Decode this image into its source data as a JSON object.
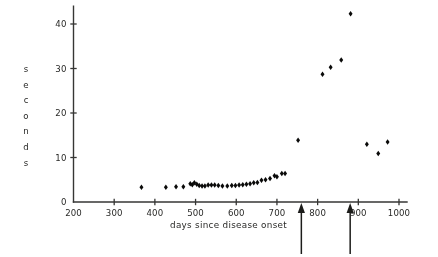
{
  "figure": {
    "background_color": "#ffffff",
    "ink_color": "#111110"
  },
  "chart_data": {
    "type": "scatter",
    "title": "",
    "xlabel": "days since disease onset",
    "ylabel": "seconds",
    "ylabel_chars": [
      "s",
      "e",
      "c",
      "o",
      "n",
      "d",
      "s"
    ],
    "xlim": [
      200,
      1000
    ],
    "ylim": [
      0,
      44
    ],
    "xticks": [
      200,
      300,
      400,
      500,
      600,
      700,
      800,
      900,
      1000
    ],
    "xtick_labels": [
      "200",
      "300",
      "400",
      "500",
      "600",
      "700",
      "800",
      "900",
      "1000"
    ],
    "yticks": [
      0,
      10,
      20,
      30,
      40
    ],
    "ytick_labels": [
      "0",
      "10",
      "20",
      "30",
      "40"
    ],
    "grid": false,
    "legend": null,
    "marker": "diamond",
    "marker_color": "#111110",
    "points": [
      {
        "x": 367,
        "y": 3.3
      },
      {
        "x": 427,
        "y": 3.3
      },
      {
        "x": 452,
        "y": 3.4
      },
      {
        "x": 470,
        "y": 3.4
      },
      {
        "x": 487,
        "y": 4.1
      },
      {
        "x": 492,
        "y": 3.9
      },
      {
        "x": 497,
        "y": 4.3
      },
      {
        "x": 503,
        "y": 4.0
      },
      {
        "x": 509,
        "y": 3.7
      },
      {
        "x": 516,
        "y": 3.6
      },
      {
        "x": 523,
        "y": 3.6
      },
      {
        "x": 531,
        "y": 3.8
      },
      {
        "x": 539,
        "y": 3.8
      },
      {
        "x": 547,
        "y": 3.8
      },
      {
        "x": 556,
        "y": 3.7
      },
      {
        "x": 566,
        "y": 3.6
      },
      {
        "x": 578,
        "y": 3.6
      },
      {
        "x": 589,
        "y": 3.7
      },
      {
        "x": 598,
        "y": 3.7
      },
      {
        "x": 607,
        "y": 3.8
      },
      {
        "x": 616,
        "y": 3.9
      },
      {
        "x": 625,
        "y": 4.0
      },
      {
        "x": 634,
        "y": 4.1
      },
      {
        "x": 643,
        "y": 4.3
      },
      {
        "x": 652,
        "y": 4.4
      },
      {
        "x": 662,
        "y": 4.9
      },
      {
        "x": 672,
        "y": 5.0
      },
      {
        "x": 683,
        "y": 5.3
      },
      {
        "x": 694,
        "y": 5.9
      },
      {
        "x": 700,
        "y": 5.7
      },
      {
        "x": 712,
        "y": 6.4
      },
      {
        "x": 720,
        "y": 6.4
      },
      {
        "x": 752,
        "y": 13.9
      },
      {
        "x": 812,
        "y": 28.7
      },
      {
        "x": 832,
        "y": 30.3
      },
      {
        "x": 858,
        "y": 31.9
      },
      {
        "x": 881,
        "y": 42.3
      },
      {
        "x": 921,
        "y": 13.0
      },
      {
        "x": 949,
        "y": 10.9
      },
      {
        "x": 972,
        "y": 13.5
      }
    ],
    "annotations": [
      {
        "type": "arrow",
        "x": 760,
        "direction": "up",
        "label": ""
      },
      {
        "type": "arrow",
        "x": 880,
        "direction": "up",
        "label": ""
      }
    ]
  }
}
